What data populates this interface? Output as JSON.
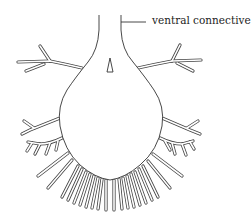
{
  "diagram": {
    "labels": {
      "connective": "ventral connective"
    },
    "colors": {
      "line": "#333333",
      "background": "#ffffff"
    }
  }
}
